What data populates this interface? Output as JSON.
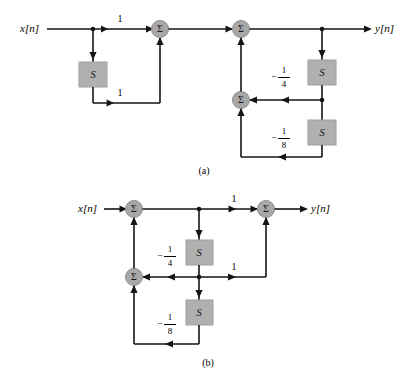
{
  "figure": {
    "colors": {
      "wire": "#151515",
      "adder_fill": "#a8a8a8",
      "delay_fill": "#b0b0b0",
      "background": "#ffffff"
    },
    "panels": [
      {
        "id": "a",
        "caption": "(a)",
        "input_label": "x[n]",
        "output_label": "y[n]",
        "adders": [
          {
            "name": "adder-a1",
            "symbol": "Σ"
          },
          {
            "name": "adder-a2",
            "symbol": "Σ"
          },
          {
            "name": "adder-a3",
            "symbol": "Σ"
          }
        ],
        "delays": [
          {
            "name": "delay-a1",
            "symbol": "S"
          },
          {
            "name": "delay-a2",
            "symbol": "S"
          },
          {
            "name": "delay-a3",
            "symbol": "S"
          }
        ],
        "gains": [
          {
            "name": "gain-a-feedforward-direct",
            "text": "1",
            "kind": "integer"
          },
          {
            "name": "gain-a-feedforward-delayed",
            "text": "1",
            "kind": "integer"
          },
          {
            "name": "gain-a-feedback-quarter",
            "text": "-1/4",
            "kind": "fraction",
            "sign": "−",
            "numerator": "1",
            "denominator": "4"
          },
          {
            "name": "gain-a-feedback-eighth",
            "text": "-1/8",
            "kind": "fraction",
            "sign": "−",
            "numerator": "1",
            "denominator": "8"
          }
        ]
      },
      {
        "id": "b",
        "caption": "(b)",
        "input_label": "x[n]",
        "output_label": "y[n]",
        "adders": [
          {
            "name": "adder-b1",
            "symbol": "Σ"
          },
          {
            "name": "adder-b2",
            "symbol": "Σ"
          },
          {
            "name": "adder-b3",
            "symbol": "Σ"
          }
        ],
        "delays": [
          {
            "name": "delay-b1",
            "symbol": "S"
          },
          {
            "name": "delay-b2",
            "symbol": "S"
          }
        ],
        "gains": [
          {
            "name": "gain-b-feedforward-direct",
            "text": "1",
            "kind": "integer"
          },
          {
            "name": "gain-b-feedforward-delayed",
            "text": "1",
            "kind": "integer"
          },
          {
            "name": "gain-b-feedback-quarter",
            "text": "-1/4",
            "kind": "fraction",
            "sign": "−",
            "numerator": "1",
            "denominator": "4"
          },
          {
            "name": "gain-b-feedback-eighth",
            "text": "-1/8",
            "kind": "fraction",
            "sign": "−",
            "numerator": "1",
            "denominator": "8"
          }
        ]
      }
    ]
  }
}
